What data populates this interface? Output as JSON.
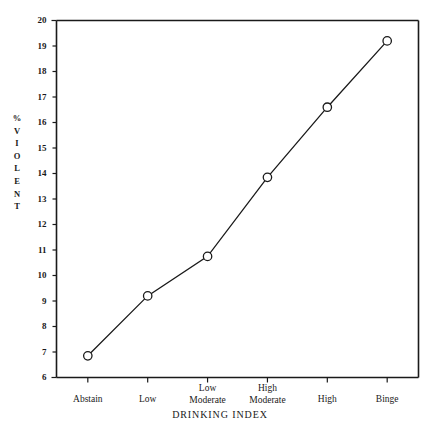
{
  "chart_data": {
    "type": "line",
    "title": "",
    "xlabel": "DRINKING INDEX",
    "ylabel": "% VIOLENT",
    "categories": [
      "Abstain",
      "Low",
      "Low Moderate",
      "High Moderate",
      "High",
      "Binge"
    ],
    "values": [
      6.85,
      9.2,
      10.75,
      13.85,
      16.6,
      19.2
    ],
    "ylim": [
      6,
      20
    ],
    "ytick_labels": [
      "6",
      "7",
      "8",
      "9",
      "10",
      "11",
      "12",
      "13",
      "14",
      "15",
      "16",
      "17",
      "18",
      "19",
      "20"
    ],
    "ytick_values": [
      6,
      7,
      8,
      9,
      10,
      11,
      12,
      13,
      14,
      15,
      16,
      17,
      18,
      19,
      20
    ],
    "grid": false,
    "legend": false,
    "marker": "open-circle",
    "line_color": "#1a1a1a",
    "marker_fill": "#ffffff",
    "marker_stroke": "#1a1a1a",
    "axis_color": "#1a1a1a",
    "background": "#ffffff"
  },
  "y_axis_caption_letters": [
    "%",
    "V",
    "I",
    "O",
    "L",
    "E",
    "N",
    "T"
  ],
  "x_axis_title": "DRINKING INDEX"
}
